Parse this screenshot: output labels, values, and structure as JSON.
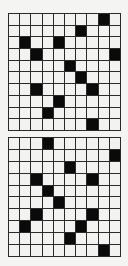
{
  "puzzle": {
    "rows": 10,
    "cols": 10,
    "colors": {
      "filled": "#0a0a0a",
      "empty": "#f2f2f0",
      "grid_line": "#2a2a2a"
    },
    "grids": [
      {
        "id": "top",
        "filled": [
          [
            0,
            8
          ],
          [
            1,
            6
          ],
          [
            2,
            1
          ],
          [
            2,
            4
          ],
          [
            3,
            2
          ],
          [
            3,
            9
          ],
          [
            4,
            5
          ],
          [
            5,
            6
          ],
          [
            6,
            2
          ],
          [
            6,
            7
          ],
          [
            7,
            4
          ],
          [
            8,
            3
          ],
          [
            9,
            7
          ]
        ]
      },
      {
        "id": "bottom",
        "filled": [
          [
            0,
            3
          ],
          [
            1,
            9
          ],
          [
            2,
            5
          ],
          [
            3,
            2
          ],
          [
            3,
            7
          ],
          [
            4,
            3
          ],
          [
            5,
            4
          ],
          [
            6,
            2
          ],
          [
            6,
            7
          ],
          [
            7,
            1
          ],
          [
            7,
            6
          ],
          [
            8,
            5
          ],
          [
            9,
            8
          ]
        ]
      }
    ]
  }
}
